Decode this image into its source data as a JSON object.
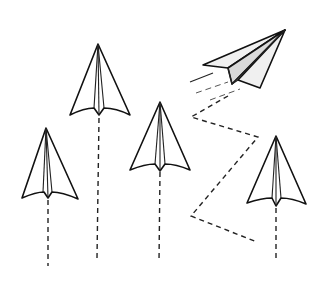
{
  "illustration": {
    "title": "Paper airplanes",
    "background": "#ffffff",
    "stroke_color": "#111111",
    "accent_gray": "#d9d9d9",
    "planes": [
      {
        "name": "plane-far-left",
        "direction": "up",
        "trail": "straight-dashed"
      },
      {
        "name": "plane-left-center",
        "direction": "up",
        "trail": "straight-dashed"
      },
      {
        "name": "plane-center",
        "direction": "up",
        "trail": "straight-dashed"
      },
      {
        "name": "plane-top-right",
        "direction": "up-right",
        "trail": "zigzag-dashed"
      },
      {
        "name": "plane-right",
        "direction": "up",
        "trail": "straight-dashed"
      }
    ]
  }
}
